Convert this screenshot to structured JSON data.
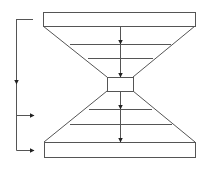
{
  "diagram": {
    "type": "hourglass-flow",
    "colors": {
      "stroke": "#555555",
      "arrow": "#222222",
      "background": "#ffffff"
    },
    "top_bar": {
      "x": 43,
      "y": 12,
      "w": 152,
      "h": 14
    },
    "middle_box": {
      "x": 107,
      "y": 77,
      "w": 26,
      "h": 14
    },
    "bottom_bar": {
      "x": 44,
      "y": 142,
      "w": 151,
      "h": 15
    },
    "upper_funnel": {
      "levels": [
        {
          "y": 44,
          "x1": 70,
          "x2": 171
        },
        {
          "y": 58,
          "x1": 88,
          "x2": 153
        }
      ]
    },
    "lower_funnel": {
      "levels": [
        {
          "y": 109,
          "x1": 89,
          "x2": 152
        },
        {
          "y": 124,
          "x1": 70,
          "x2": 172
        }
      ]
    },
    "center_arrows_tip_y": [
      44,
      77,
      109,
      142
    ],
    "left_bracket": {
      "x": 16,
      "top_y": 19,
      "bottom_y": 150,
      "mid_arrow_y": 84,
      "branch_arrows": [
        {
          "y": 115,
          "to_x": 34
        },
        {
          "y": 150,
          "to_x": 34
        }
      ]
    }
  }
}
